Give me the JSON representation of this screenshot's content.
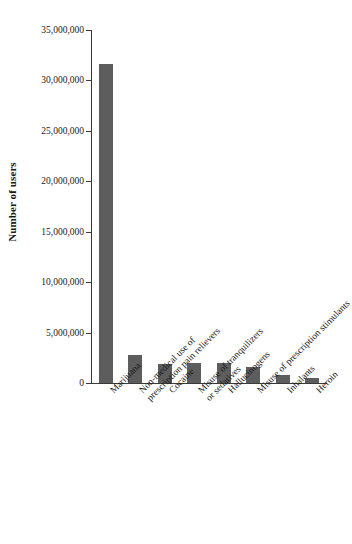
{
  "chart_data": {
    "type": "bar",
    "title": "",
    "xlabel": "",
    "ylabel": "Number of users",
    "ylim": [
      0,
      35000000
    ],
    "grid": false,
    "legend": "none",
    "orientation": "vertical",
    "bar_color": "#5d5d5d",
    "axis_color": "#3b3b3b",
    "ytick_values": [
      0,
      5000000,
      10000000,
      15000000,
      20000000,
      25000000,
      30000000,
      35000000
    ],
    "ytick_labels": [
      "0",
      "5,000,000",
      "10,000,000",
      "15,000,000",
      "20,000,000",
      "25,000,000",
      "30,000,000",
      "35,000,000"
    ],
    "categories": [
      "Marijuana",
      "Non-medical use of prescription pain relievers",
      "Cocaine",
      "Misuse of tranquilizers or sedatives",
      "Hallucinogens",
      "Misuse of prescription stimulants",
      "Inhalants",
      "Heroin"
    ],
    "category_lines": [
      [
        "Marijuana"
      ],
      [
        "Non-medical use of",
        "prescription pain relievers"
      ],
      [
        "Cocaine"
      ],
      [
        "Misuse of tranquilizers",
        "or sedatives"
      ],
      [
        "Hallucinogens"
      ],
      [
        "Misuse of prescription stimulants"
      ],
      [
        "Inhalants"
      ],
      [
        "Heroin"
      ]
    ],
    "values": [
      31600000,
      2800000,
      1900000,
      2000000,
      1950000,
      1600000,
      800000,
      450000
    ]
  }
}
